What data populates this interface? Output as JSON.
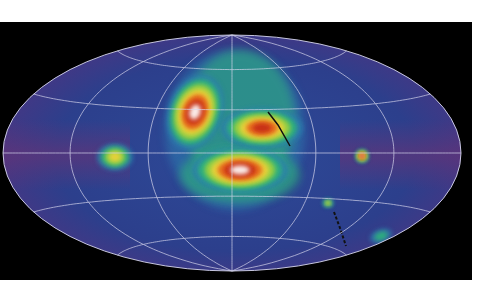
{
  "figure": {
    "kind": "all-sky map",
    "projection": "Hammer-Aitoff",
    "background_color": "#000000",
    "page_color": "#ffffff",
    "sky_base_color": "#2c3f8c",
    "sky_edge_tint": "#6a3275",
    "graticule_color": "#d8d8ee",
    "graticule": {
      "meridian_step_deg": 60,
      "parallel_step_deg": 30
    },
    "colormap": [
      "#2c3f8c",
      "#2f7fb0",
      "#2fb37a",
      "#9fd23c",
      "#f0d23a",
      "#e8641e",
      "#c42a14",
      "#ffffff"
    ]
  },
  "features": [
    {
      "name": "upper-left-cloud",
      "cx": 195,
      "cy": 112,
      "rx": 24,
      "ry": 34,
      "level": 7,
      "rot": 20
    },
    {
      "name": "upper-right-cluster",
      "cx": 262,
      "cy": 128,
      "rx": 36,
      "ry": 18,
      "level": 6,
      "rot": 0
    },
    {
      "name": "central-lower-cloud",
      "cx": 240,
      "cy": 170,
      "rx": 42,
      "ry": 20,
      "level": 7,
      "rot": 0
    },
    {
      "name": "left-plane-feature",
      "cx": 115,
      "cy": 157,
      "rx": 16,
      "ry": 12,
      "level": 4,
      "rot": 0
    },
    {
      "name": "bright-blob",
      "cx": 362,
      "cy": 156,
      "rx": 6,
      "ry": 6,
      "level": 7,
      "rot": 0
    },
    {
      "name": "yellow-spot",
      "cx": 328,
      "cy": 203,
      "rx": 5,
      "ry": 4,
      "level": 4,
      "rot": 0
    },
    {
      "name": "green-patch",
      "cx": 381,
      "cy": 236,
      "rx": 10,
      "ry": 6,
      "level": 2,
      "rot": -20
    }
  ]
}
